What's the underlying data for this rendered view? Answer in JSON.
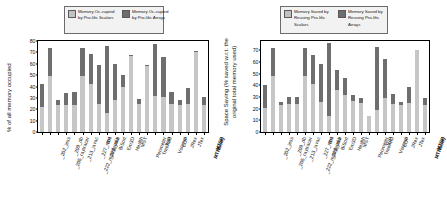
{
  "figure": {
    "panels": [
      "memory-occupied",
      "space-saving"
    ]
  },
  "left": {
    "ylabel": "% of all memory occupied",
    "legend": {
      "scalars": "Memory Oc-cupied by Pro-lific Scalars",
      "arrays": "Memory Oc-cupied by Pro-lific Arrays"
    },
    "colors": {
      "scalars": "#c6c6c6",
      "arrays": "#6e6e6e"
    }
  },
  "right": {
    "ylabel": "Space Saving (% saved w.r.t. the original total memory used)",
    "legend": {
      "scalars": "Memory Saved by Reusing Pro-lific Scalars",
      "arrays": "Memory Saved by Reusing Pro-lific Arrays"
    },
    "colors": {
      "scalars": "#c6c6c6",
      "arrays": "#6e6e6e"
    }
  },
  "chart_data": [
    {
      "type": "bar",
      "stacked": true,
      "title": "",
      "xlabel": "",
      "ylabel": "% of all memory occupied",
      "ylim": [
        0,
        80
      ],
      "yticks": [
        0,
        10,
        20,
        30,
        40,
        50,
        60,
        70,
        80
      ],
      "grid": false,
      "legend_position": "top",
      "categories": [
        "_202_jess",
        "_205_raytracer",
        "_209_db",
        "_213_javac",
        "_222_mpegaudio",
        "_227_mtrt",
        "_228_jack",
        "BH",
        "BiSort",
        "Em3D",
        "Health",
        "MST",
        "Perimeter",
        "TreeAdd",
        "TSP",
        "Voronoi",
        "CUP",
        "JRex",
        "JTex",
        "MTNbody",
        "MTSP"
      ],
      "series": [
        {
          "name": "Memory Occupied by Prolific Scalars",
          "color": "#c6c6c6",
          "values": [
            22,
            49,
            24,
            24,
            24,
            49,
            42,
            25,
            17,
            28,
            40,
            67,
            25,
            58,
            32,
            31,
            25,
            24,
            25,
            70,
            24
          ]
        },
        {
          "name": "Memory Occupied by Prolific Arrays",
          "color": "#6e6e6e",
          "values": [
            20,
            25,
            4,
            10,
            11,
            25,
            27,
            34,
            59,
            32,
            10,
            1,
            4,
            1,
            45,
            35,
            10,
            4,
            14,
            1,
            7
          ]
        }
      ],
      "totals": [
        42,
        74,
        28,
        34,
        35,
        74,
        69,
        59,
        76,
        60,
        50,
        68,
        29,
        59,
        77,
        66,
        35,
        28,
        39,
        71,
        31
      ]
    },
    {
      "type": "bar",
      "stacked": true,
      "title": "",
      "xlabel": "",
      "ylabel": "Space Saving (% saved w.r.t. the original total memory used)",
      "ylim": [
        0,
        78
      ],
      "yticks": [
        0,
        10,
        20,
        30,
        40,
        50,
        60,
        70
      ],
      "grid": false,
      "legend_position": "top",
      "categories": [
        "_202_jess",
        "_205_raytracer",
        "_209_db",
        "_213_javac",
        "_222_mpegaudio",
        "_227_mtrt",
        "_228_jack",
        "BH",
        "BiSort",
        "Em3D",
        "Health",
        "MST",
        "Perimeter",
        "TreeAdd",
        "TSP",
        "Voronoi",
        "CUP",
        "JRex",
        "JTex",
        "MTNbody",
        "MTSP"
      ],
      "series": [
        {
          "name": "Memory Saved by Reusing Prolific Scalars",
          "color": "#c6c6c6",
          "values": [
            21,
            48,
            23,
            24,
            24,
            48,
            41,
            26,
            14,
            36,
            32,
            27,
            25,
            14,
            19,
            29,
            24,
            23,
            25,
            70,
            23
          ]
        },
        {
          "name": "Memory Saved by Reusing Prolific Arrays",
          "color": "#6e6e6e",
          "values": [
            19,
            24,
            3,
            6,
            6,
            24,
            25,
            32,
            62,
            17,
            14,
            5,
            4,
            0,
            54,
            34,
            9,
            3,
            14,
            0,
            6
          ]
        }
      ],
      "totals": [
        40,
        72,
        26,
        30,
        30,
        72,
        66,
        58,
        76,
        53,
        46,
        32,
        29,
        14,
        73,
        63,
        33,
        26,
        39,
        70,
        29
      ]
    }
  ]
}
